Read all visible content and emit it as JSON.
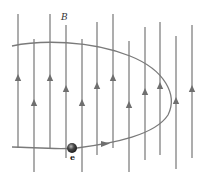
{
  "diagram": {
    "title": "",
    "field_label": "B",
    "particle_label": "e",
    "colors": {
      "field_line": "#8a8a8a",
      "arrow": "#6f6f6f",
      "trajectory": "#7a7a7a",
      "particle": "#3a3a3a",
      "background": "#ffffff"
    },
    "field_lines": [
      {
        "x": 18,
        "top": 14,
        "bottom": 148,
        "arrow_y": 78
      },
      {
        "x": 34,
        "top": 39,
        "bottom": 172,
        "arrow_y": 103
      },
      {
        "x": 50,
        "top": 14,
        "bottom": 148,
        "arrow_y": 78
      },
      {
        "x": 66,
        "top": 25,
        "bottom": 158,
        "arrow_y": 89
      },
      {
        "x": 82,
        "top": 39,
        "bottom": 172,
        "arrow_y": 103
      },
      {
        "x": 97,
        "top": 22,
        "bottom": 155,
        "arrow_y": 86
      },
      {
        "x": 113,
        "top": 14,
        "bottom": 148,
        "arrow_y": 78
      },
      {
        "x": 129,
        "top": 41,
        "bottom": 172,
        "arrow_y": 105
      },
      {
        "x": 145,
        "top": 27,
        "bottom": 160,
        "arrow_y": 92
      },
      {
        "x": 160,
        "top": 22,
        "bottom": 155,
        "arrow_y": 86
      },
      {
        "x": 176,
        "top": 36,
        "bottom": 169,
        "arrow_y": 101
      },
      {
        "x": 192,
        "top": 25,
        "bottom": 158,
        "arrow_y": 89
      }
    ],
    "particle": {
      "cx": 72,
      "cy": 148,
      "r": 5
    },
    "trajectory_arrow": {
      "x": 106,
      "y": 144
    }
  }
}
